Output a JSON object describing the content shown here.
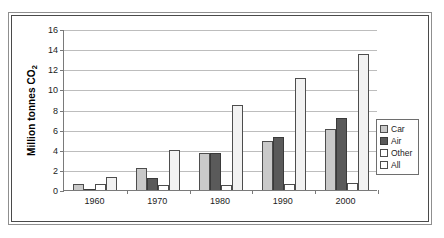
{
  "chart_data": {
    "type": "bar",
    "title": "",
    "subtitle": "",
    "xlabel": "",
    "ylabel": "Million tonnes CO2",
    "ylabel_parts": {
      "main": "Million tonnes CO",
      "sub": "2"
    },
    "categories": [
      "1960",
      "1970",
      "1980",
      "1990",
      "2000"
    ],
    "series": [
      {
        "name": "Car",
        "color": "#c9c9c9",
        "values": [
          0.6,
          2.2,
          3.7,
          4.9,
          6.1
        ]
      },
      {
        "name": "Air",
        "color": "#5a5a5a",
        "values": [
          0.15,
          1.2,
          3.7,
          5.3,
          7.2
        ]
      },
      {
        "name": "Other",
        "color": "#ffffff",
        "values": [
          0.6,
          0.5,
          0.5,
          0.6,
          0.7
        ]
      },
      {
        "name": "All",
        "color": "#f2f2f2",
        "values": [
          1.3,
          4.0,
          8.4,
          11.1,
          13.5
        ]
      }
    ],
    "ylim": [
      0,
      16
    ],
    "yticks": [
      "0",
      "2",
      "4",
      "6",
      "8",
      "10",
      "12",
      "14",
      "16"
    ],
    "ytick_values": [
      0,
      2,
      4,
      6,
      8,
      10,
      12,
      14,
      16
    ],
    "grid": true,
    "legend_position": "right-inside",
    "legend_entries": [
      "Car",
      "Air",
      "Other",
      "All"
    ]
  },
  "colors": {
    "car": "#c9c9c9",
    "air": "#5a5a5a",
    "other": "#ffffff",
    "all": "#f2f2f2",
    "gridline": "#bdbdbd",
    "axis": "#7a7a7a",
    "frame": "#4a4a4a",
    "text": "#1c1c1c"
  }
}
